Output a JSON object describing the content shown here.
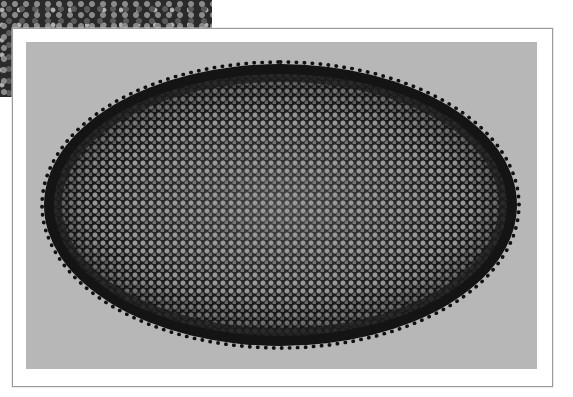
{
  "scene": {
    "description": "Photograph of an oval braided rug printed on a white-bordered photo, with a close-up texture inset in the top-left corner",
    "inset": {
      "subject": "close-up of braided rug texture"
    },
    "main_photo": {
      "subject": "oval braided rug",
      "background_color": "#b7b7b7",
      "rug_border_color": "#141414"
    },
    "frame_color": "#ffffff"
  }
}
